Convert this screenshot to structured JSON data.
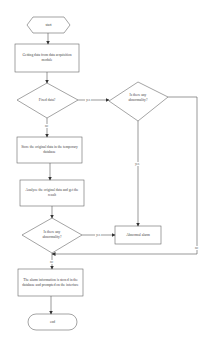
{
  "diagram": {
    "type": "flowchart",
    "nodes": {
      "start": {
        "label": "start",
        "shape": "hexagon"
      },
      "get_data": {
        "label": "Getting data from data acquisition module",
        "shape": "rectangle"
      },
      "fixed_data": {
        "label": "Fixed data?",
        "shape": "diamond"
      },
      "abnormal_check_1": {
        "label": "Is there any abnormality?",
        "shape": "diamond"
      },
      "store_temp": {
        "label": "Store the original data in the temporary database",
        "shape": "rectangle"
      },
      "analyze": {
        "label": "Analyze the original data and get the result",
        "shape": "rectangle"
      },
      "abnormal_check_2": {
        "label": "Is there any abnormality?",
        "shape": "diamond"
      },
      "abnormal_alarm": {
        "label": "Abnormal alarm",
        "shape": "rectangle"
      },
      "store_alarm": {
        "label": "The alarm information is stored in the database and prompted on the interface",
        "shape": "rectangle"
      },
      "end": {
        "label": "end",
        "shape": "terminator"
      }
    },
    "edge_labels": {
      "fixed_yes": "yes",
      "fixed_no": "no",
      "check1_yes": "yes",
      "check1_no": "no",
      "check2_yes": "yes",
      "check2_no": "no"
    },
    "edges": [
      {
        "from": "start",
        "to": "get_data"
      },
      {
        "from": "get_data",
        "to": "fixed_data"
      },
      {
        "from": "fixed_data",
        "to": "abnormal_check_1",
        "label": "yes"
      },
      {
        "from": "fixed_data",
        "to": "store_temp",
        "label": "no"
      },
      {
        "from": "store_temp",
        "to": "analyze"
      },
      {
        "from": "analyze",
        "to": "abnormal_check_2"
      },
      {
        "from": "abnormal_check_2",
        "to": "abnormal_alarm",
        "label": "yes"
      },
      {
        "from": "abnormal_check_1",
        "to": "abnormal_alarm",
        "label": "yes"
      },
      {
        "from": "abnormal_check_1",
        "to": "store_alarm",
        "label": "no"
      },
      {
        "from": "abnormal_check_2",
        "to": "store_alarm",
        "label": "no"
      },
      {
        "from": "store_alarm",
        "to": "end"
      }
    ],
    "colors": {
      "stroke": "#555555",
      "background": "#ffffff",
      "text": "#444444"
    }
  }
}
